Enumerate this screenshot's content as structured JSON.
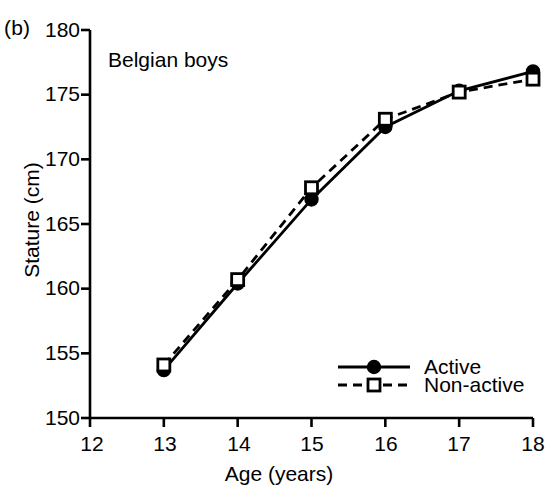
{
  "panel": {
    "label": "(b)"
  },
  "chart_data": {
    "type": "line",
    "title": "Belgian boys",
    "xlabel": "Age (years)",
    "ylabel": "Stature (cm)",
    "xlim": [
      12,
      18
    ],
    "ylim": [
      150,
      180
    ],
    "xticks": [
      "12",
      "13",
      "14",
      "15",
      "16",
      "17",
      "18"
    ],
    "yticks": [
      "150",
      "155",
      "160",
      "165",
      "170",
      "175",
      "180"
    ],
    "grid": false,
    "legend_position": "bottom-right",
    "x": [
      13,
      14,
      15,
      16,
      17,
      18
    ],
    "series": [
      {
        "name": "Active",
        "values": [
          153.7,
          160.4,
          166.9,
          172.5,
          175.3,
          176.8
        ],
        "line_style": "solid",
        "marker": "filled-circle",
        "color": "#000000"
      },
      {
        "name": "Non-active",
        "values": [
          154.1,
          160.7,
          167.8,
          173.1,
          175.2,
          176.2
        ],
        "line_style": "dashed",
        "marker": "open-square",
        "color": "#000000"
      }
    ]
  },
  "legend": {
    "items": [
      {
        "label": "Active"
      },
      {
        "label": "Non-active"
      }
    ]
  }
}
